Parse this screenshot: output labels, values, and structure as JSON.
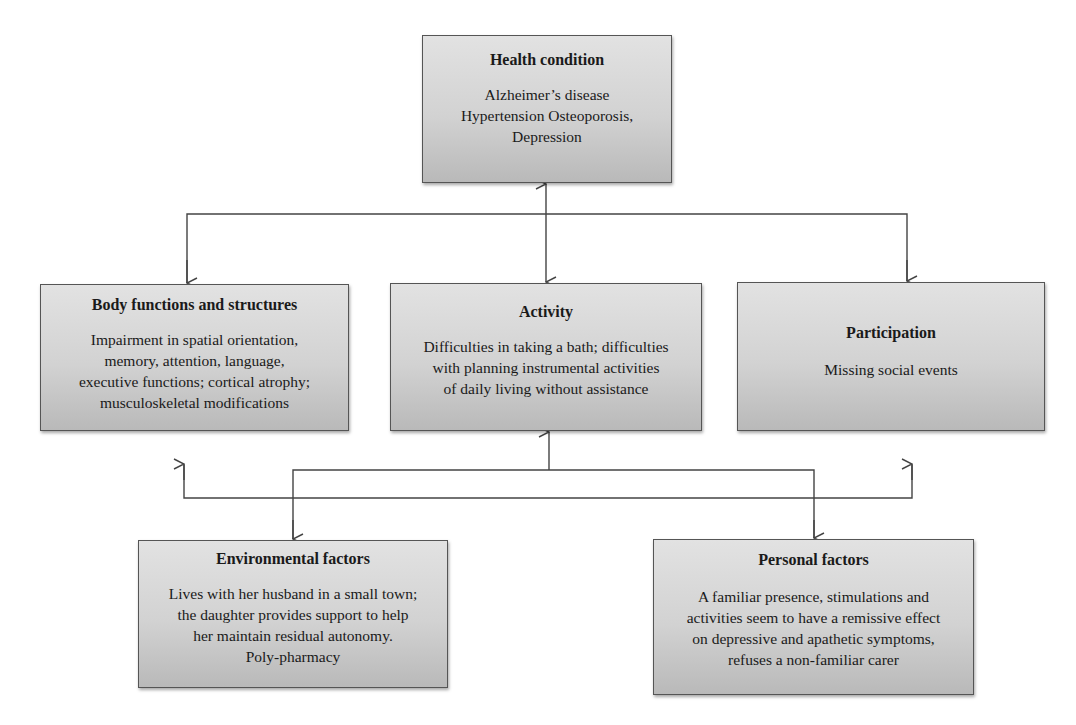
{
  "diagram": {
    "nodes": {
      "health_condition": {
        "title": "Health condition",
        "lines": [
          "Alzheimer’s disease",
          "Hypertension Osteoporosis,",
          "Depression"
        ]
      },
      "body_functions": {
        "title": "Body functions and structures",
        "lines": [
          "Impairment in spatial orientation,",
          "memory, attention, language,",
          "executive functions; cortical atrophy;",
          "musculoskeletal modifications"
        ]
      },
      "activity": {
        "title": "Activity",
        "lines": [
          "Difficulties in taking a bath; difficulties",
          "with planning instrumental activities",
          "of daily living without assistance"
        ]
      },
      "participation": {
        "title": "Participation",
        "lines": [
          "Missing social events"
        ]
      },
      "environmental_factors": {
        "title": "Environmental factors",
        "lines": [
          "Lives with her husband in a small town;",
          "the daughter provides support to help",
          "her maintain residual autonomy.",
          "Poly-pharmacy"
        ]
      },
      "personal_factors": {
        "title": "Personal factors",
        "lines": [
          "A familiar presence, stimulations and",
          "activities seem to have a remissive effect",
          "on depressive and apathetic symptoms,",
          "refuses a non-familiar carer"
        ]
      }
    },
    "edges": [
      {
        "from": "health_condition",
        "to": "activity",
        "type": "bidirectional"
      },
      {
        "from": "health_condition",
        "to": "body_functions",
        "type": "directed"
      },
      {
        "from": "health_condition",
        "to": "participation",
        "type": "directed"
      },
      {
        "from": "activity",
        "to": "environmental_factors",
        "type": "directed"
      },
      {
        "from": "activity",
        "to": "personal_factors",
        "type": "directed"
      },
      {
        "from": "contextual_bus",
        "to": "body_functions",
        "type": "directed"
      },
      {
        "from": "contextual_bus",
        "to": "participation",
        "type": "directed"
      }
    ],
    "colors": {
      "box_top": "#e2e2e2",
      "box_bottom": "#b9b9b9",
      "border": "#555555",
      "line": "#444444"
    }
  }
}
